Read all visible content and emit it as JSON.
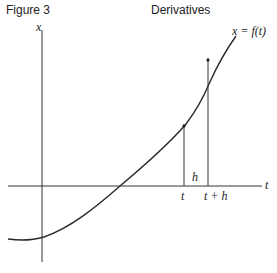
{
  "header": {
    "figure_label": "Figure 3",
    "title": "Derivatives"
  },
  "diagram": {
    "axis_labels": {
      "vertical": "x",
      "horizontal": "t"
    },
    "curve_label": "x = f(t)",
    "tick_labels": {
      "t": "t",
      "t_plus_h": "t + h"
    },
    "interval_label": "h",
    "colors": {
      "line": "#2a2a2a",
      "axis": "#333333"
    }
  }
}
